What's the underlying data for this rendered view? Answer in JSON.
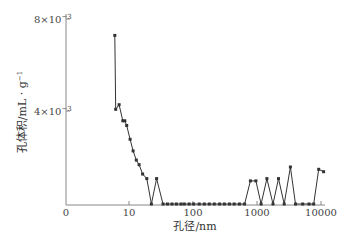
{
  "chart_data": {
    "type": "line",
    "title": "",
    "xlabel": "孔径/nm",
    "ylabel": "孔体积/mL·g⁻¹",
    "x_scale": "log",
    "x_ticks": [
      "0",
      "10",
      "100",
      "1000",
      "10000"
    ],
    "y_ticks": [
      "4×10⁻³",
      "8×10⁻³"
    ],
    "ylim": [
      0,
      0.008
    ],
    "xlim": [
      3,
      12000
    ],
    "grid": false,
    "legend": null,
    "series": [
      {
        "name": "pore volume",
        "marker": "square",
        "x": [
          6.0,
          6.2,
          7.0,
          8.0,
          8.6,
          9.2,
          10.4,
          11.6,
          13.0,
          14.4,
          16.3,
          19.0,
          22.4,
          27.0,
          34.0,
          40.0,
          47.0,
          55.0,
          65.0,
          73.0,
          87.0,
          102,
          125,
          150,
          180,
          215,
          260,
          310,
          370,
          440,
          530,
          640,
          790,
          960,
          1160,
          1430,
          1780,
          2170,
          2660,
          3330,
          4000,
          5170,
          6500,
          7700,
          9200,
          11000
        ],
        "y": [
          0.0073,
          0.0041,
          0.0043,
          0.0036,
          0.0036,
          0.0034,
          0.0028,
          0.0023,
          0.0019,
          0.0017,
          0.0013,
          0.0011,
          0.0,
          0.0011,
          0.0,
          0.0,
          0.0,
          0.0,
          0.0,
          0.0,
          0.0,
          0.0,
          0.0,
          0.0,
          0.0,
          0.0,
          0.0,
          0.0,
          0.0,
          0.0,
          0.0,
          0.0,
          0.001,
          0.001,
          0.0,
          0.0011,
          0.0,
          0.0011,
          0.0,
          0.0016,
          0.0,
          0.0,
          0.0,
          0.0,
          0.0015,
          0.0014
        ]
      }
    ]
  },
  "plot": {
    "x_label": "孔径/nm",
    "y_label": "孔体积/mL · g",
    "y_label_sup": "−1",
    "y_tick_8": "8×10",
    "y_tick_8_sup": "−3",
    "y_tick_4": "4×10",
    "y_tick_4_sup": "−3",
    "x_tick_0": "0",
    "x_tick_10": "10",
    "x_tick_100": "100",
    "x_tick_1000": "1000",
    "x_tick_10000": "10000",
    "line_color": "#333333",
    "axis_color": "#888888"
  }
}
